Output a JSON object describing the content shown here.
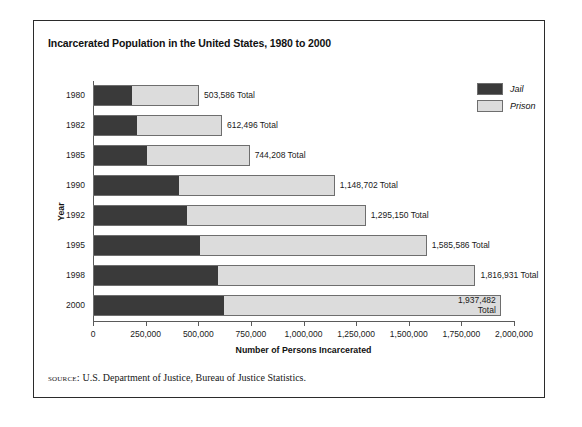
{
  "figure": {
    "title": "Incarcerated Population in the United States, 1980 to 2000",
    "source_label": "source:",
    "source_text": "U.S. Department of Justice, Bureau of Justice Statistics."
  },
  "legend": {
    "position": "right",
    "items": [
      {
        "label": "Jail",
        "color": "#3a3a3a"
      },
      {
        "label": "Prison",
        "color": "#dcdcdc"
      }
    ]
  },
  "axes": {
    "x_title": "Number of Persons Incarcerated",
    "y_title": "Year",
    "x_ticks": [
      "0",
      "250,000",
      "500,000",
      "750,000",
      "1,000,000",
      "1,250,000",
      "1,500,000",
      "1,750,000",
      "2,000,000"
    ],
    "x_tick_values": [
      0,
      250000,
      500000,
      750000,
      1000000,
      1250000,
      1500000,
      1750000,
      2000000
    ],
    "x_min": 0,
    "x_max": 2000000
  },
  "chart_data": {
    "type": "bar",
    "orientation": "horizontal",
    "stacked": true,
    "title": "Incarcerated Population in the United States, 1980 to 2000",
    "xlabel": "Number of Persons Incarcerated",
    "ylabel": "Year",
    "xlim": [
      0,
      2000000
    ],
    "grid": false,
    "legend_position": "right",
    "categories": [
      "1980",
      "1982",
      "1985",
      "1990",
      "1992",
      "1995",
      "1998",
      "2000"
    ],
    "series": [
      {
        "name": "Jail",
        "color": "#3a3a3a",
        "values": [
          183988,
          209582,
          256615,
          405320,
          444584,
          507044,
          592462,
          621149
        ]
      },
      {
        "name": "Prison",
        "color": "#dcdcdc",
        "values": [
          319598,
          402914,
          487593,
          743382,
          850566,
          1078542,
          1224469,
          1316333
        ]
      }
    ],
    "totals": [
      503586,
      612496,
      744208,
      1148702,
      1295150,
      1585586,
      1816931,
      1937482
    ],
    "total_labels": [
      "503,586 Total",
      "612,496 Total",
      "744,208 Total",
      "1,148,702 Total",
      "1,295,150 Total",
      "1,585,586 Total",
      "1,816,931 Total",
      "1,937,482 Total"
    ]
  },
  "bars": [
    {
      "year": "1980",
      "jail": 183988,
      "prison": 319598,
      "total": 503586,
      "total_label": "503,586 Total",
      "label_inside": false
    },
    {
      "year": "1982",
      "jail": 209582,
      "prison": 402914,
      "total": 612496,
      "total_label": "612,496 Total",
      "label_inside": false
    },
    {
      "year": "1985",
      "jail": 256615,
      "prison": 487593,
      "total": 744208,
      "total_label": "744,208 Total",
      "label_inside": false
    },
    {
      "year": "1990",
      "jail": 405320,
      "prison": 743382,
      "total": 1148702,
      "total_label": "1,148,702 Total",
      "label_inside": false
    },
    {
      "year": "1992",
      "jail": 444584,
      "prison": 850566,
      "total": 1295150,
      "total_label": "1,295,150 Total",
      "label_inside": false
    },
    {
      "year": "1995",
      "jail": 507044,
      "prison": 1078542,
      "total": 1585586,
      "total_label": "1,585,586 Total",
      "label_inside": false
    },
    {
      "year": "1998",
      "jail": 592462,
      "prison": 1224469,
      "total": 1816931,
      "total_label": "1,816,931 Total",
      "label_inside": false
    },
    {
      "year": "2000",
      "jail": 621149,
      "prison": 1316333,
      "total": 1937482,
      "total_label": "1,937,482 Total",
      "label_inside": true
    }
  ]
}
